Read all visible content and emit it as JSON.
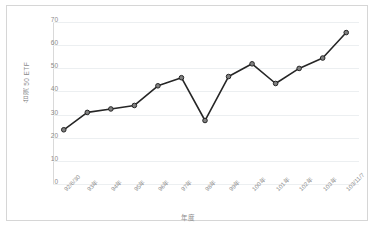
{
  "chart_data": {
    "type": "line",
    "title": "",
    "xlabel": "年度",
    "ylabel": "台灣 50 ETF",
    "categories": [
      "92/6/30",
      "93年",
      "94年",
      "95年",
      "96年",
      "97年",
      "98年",
      "99年",
      "100年",
      "101年",
      "102年",
      "103年",
      "103/11/7"
    ],
    "values": [
      23,
      30.5,
      32,
      33.5,
      42,
      45.5,
      27,
      46,
      51.5,
      43,
      49.5,
      54,
      65
    ],
    "series": [
      {
        "name": "台灣 50 ETF",
        "values": [
          23,
          30.5,
          32,
          33.5,
          42,
          45.5,
          27,
          46,
          51.5,
          43,
          49.5,
          54,
          65
        ]
      }
    ],
    "yticks": [
      0,
      10,
      20,
      30,
      40,
      50,
      60,
      70
    ],
    "ylim": [
      0,
      70
    ],
    "grid": true,
    "legend": false,
    "marker": "circle",
    "line_color": "#262626",
    "marker_fill": "#808080",
    "grid_color": "#eceff1",
    "tick_label_color": "#8c8c8c"
  }
}
